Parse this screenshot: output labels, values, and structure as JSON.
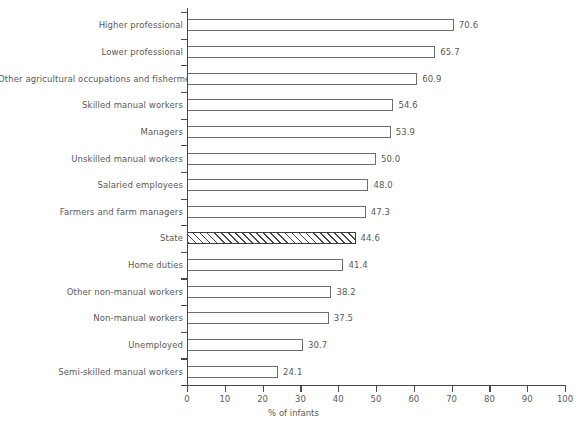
{
  "chart_data": {
    "type": "bar",
    "orientation": "horizontal",
    "title": "",
    "subtitle": "",
    "xlabel": "% of infants",
    "ylabel": "",
    "xlim": [
      0,
      100
    ],
    "xticks": [
      0,
      10,
      20,
      30,
      40,
      50,
      60,
      70,
      80,
      90,
      100
    ],
    "xtick_labels": [
      "0",
      "10",
      "20",
      "30",
      "40",
      "50",
      "60",
      "70",
      "80",
      "90",
      "100"
    ],
    "grid": false,
    "legend": null,
    "categories": [
      "Higher professional",
      "Lower professional",
      "Other agricultural occupations and fishermen",
      "Skilled manual workers",
      "Managers",
      "Unskilled manual workers",
      "Salaried employees",
      "Farmers and farm managers",
      "State",
      "Home duties",
      "Other non-manual workers",
      "Non-manual workers",
      "Unemployed",
      "Semi-skilled manual workers"
    ],
    "values": [
      70.6,
      65.7,
      60.9,
      54.6,
      53.9,
      50.0,
      48.0,
      47.3,
      44.6,
      41.4,
      38.2,
      37.5,
      30.7,
      24.1
    ],
    "value_labels": [
      "70.6",
      "65.7",
      "60.9",
      "54.6",
      "53.9",
      "50.0",
      "48.0",
      "47.3",
      "44.6",
      "41.4",
      "38.2",
      "37.5",
      "30.7",
      "24.1"
    ],
    "highlighted_category": "State",
    "highlight_style": "diagonal-hatch",
    "colors": {
      "bar_fill": "#ffffff",
      "bar_border": "#6e6e6e",
      "hatch_line": "#4a4a4a",
      "axis": "#4a4a4a",
      "text": "#5a5a5a",
      "background": "#ffffff"
    }
  }
}
